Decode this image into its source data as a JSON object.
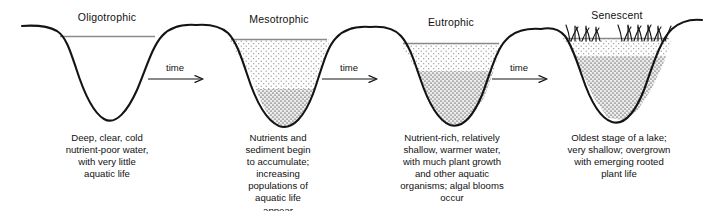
{
  "figure": {
    "background_color": "#ffffff",
    "line_color": "#111111",
    "water_line_color": "#7d7d7d",
    "water_fill_color": "#e8e8e8",
    "sediment_fill_color": "#cfcfcf"
  },
  "stages": [
    {
      "id": "oligotrophic",
      "label": "Oligotrophic",
      "caption": "Deep, clear, cold nutrient-poor water, with very little aquatic life",
      "caption_lines": [
        "Deep, clear, cold",
        "nutrient-poor water,",
        "with very little",
        "aquatic life"
      ],
      "has_sediment": false,
      "has_plants": false,
      "depth_description": "deep"
    },
    {
      "id": "mesotrophic",
      "label": "Mesotrophic",
      "caption": "Nutrients and sediment begin to accumulate; increasing populations of aquatic life appear",
      "caption_lines": [
        "Nutrients and",
        "sediment begin",
        "to accumulate;",
        "increasing",
        "populations of",
        "aquatic life",
        "appear"
      ],
      "has_sediment": true,
      "has_plants": false,
      "depth_description": "deep with sediment"
    },
    {
      "id": "eutrophic",
      "label": "Eutrophic",
      "caption": "Nutrient-rich, relatively shallow, warmer water, with much plant growth and other aquatic organisms; algal blooms occur",
      "caption_lines": [
        "Nutrient-rich, relatively",
        "shallow, warmer water,",
        "with much plant growth",
        "and other aquatic",
        "organisms; algal blooms",
        "occur"
      ],
      "has_sediment": true,
      "has_plants": false,
      "depth_description": "shallow"
    },
    {
      "id": "senescent",
      "label": "Senescent",
      "caption": "Oldest stage of a lake; very shallow; overgrown with emerging rooted plant life",
      "caption_lines": [
        "Oldest stage of a lake;",
        "very shallow; overgrown",
        "with emerging rooted",
        "plant life"
      ],
      "has_sediment": true,
      "has_plants": true,
      "depth_description": "very shallow"
    }
  ],
  "transitions": [
    {
      "id": "transition-1",
      "label": "time"
    },
    {
      "id": "transition-2",
      "label": "time"
    },
    {
      "id": "transition-3",
      "label": "time"
    }
  ]
}
